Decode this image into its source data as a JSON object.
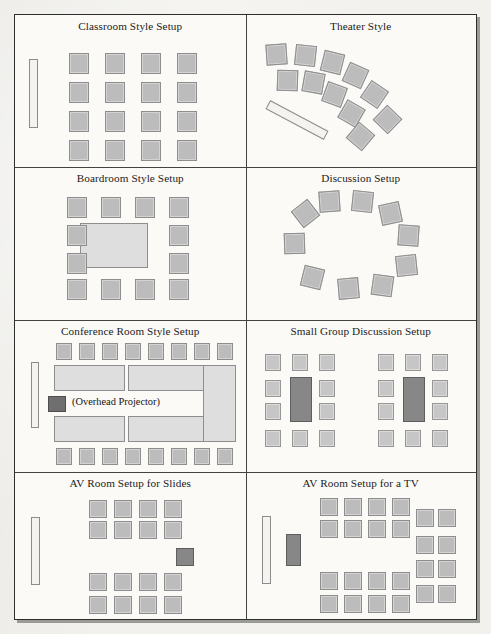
{
  "document": {
    "kind": "meeting-room-setup-diagram-page",
    "panel_rows": 4,
    "panel_columns": 2,
    "background_color": "#f2f1ed",
    "frame_border_color": "#2e2e2e",
    "chair_color": "#bcbcbc",
    "table_color": "#dedede",
    "screen_color": "#f4f3ef",
    "dark_block_color": "#878787"
  },
  "panels": [
    {
      "id": "classroom-style-setup",
      "title": "Classroom Style Setup",
      "elements": {
        "screen_label": "screen",
        "chair_rows": 4,
        "chair_columns": 4,
        "chair_count": 16
      }
    },
    {
      "id": "theater-style",
      "title": "Theater Style",
      "elements": {
        "screen_label": "screen",
        "outer_arc_chairs": 6,
        "inner_arc_chairs": 5,
        "chair_count": 11
      }
    },
    {
      "id": "boardroom-style-setup",
      "title": "Boardroom Style Setup",
      "elements": {
        "table_label": "conference table",
        "chairs_top": 4,
        "chairs_bottom": 4,
        "chairs_left": 2,
        "chairs_right": 2,
        "chair_count": 12
      }
    },
    {
      "id": "discussion-setup",
      "title": "Discussion Setup",
      "elements": {
        "arrangement": "circle",
        "chair_count": 10
      }
    },
    {
      "id": "conference-room-style-setup",
      "title": "Conference Room Style Setup",
      "caption": "(Overhead Projector)",
      "elements": {
        "screen_label": "screen",
        "chairs_top": 8,
        "chairs_bottom": 8,
        "tables": 5,
        "projector_label": "overhead projector",
        "chair_count": 16
      }
    },
    {
      "id": "small-group-discussion-setup",
      "title": "Small Group Discussion Setup",
      "elements": {
        "groups": 2,
        "chairs_per_group": 10,
        "table_per_group": 1,
        "chair_count": 20
      }
    },
    {
      "id": "av-room-setup-for-slides",
      "title": "AV Room Setup for Slides",
      "elements": {
        "screen_label": "screen",
        "front_block_rows": 2,
        "front_block_columns": 4,
        "rear_block_rows": 2,
        "rear_block_columns": 4,
        "projector_label": "slide projector",
        "chair_count": 16
      }
    },
    {
      "id": "av-room-setup-for-a-tv",
      "title": "AV Room Setup for a TV",
      "elements": {
        "screen_label": "screen",
        "tv_label": "television",
        "front_block_rows": 2,
        "front_block_columns": 4,
        "rear_block_rows": 2,
        "rear_block_columns": 4,
        "side_block_rows": 4,
        "side_block_columns": 2,
        "chair_count": 24
      }
    }
  ]
}
